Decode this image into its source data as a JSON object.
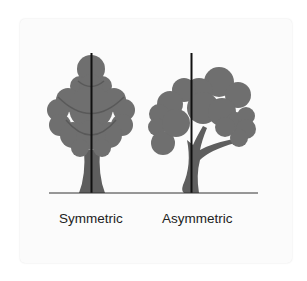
{
  "diagram": {
    "labels": {
      "symmetric": "Symmetric",
      "asymmetric": "Asymmetric"
    },
    "colors": {
      "canopy": "#6f6f6f",
      "trunk": "#5e5e5e",
      "branch_line": "#595959",
      "axis_line": "#111111",
      "ground_line": "#333333",
      "card_background": "#fbfbfb"
    }
  }
}
